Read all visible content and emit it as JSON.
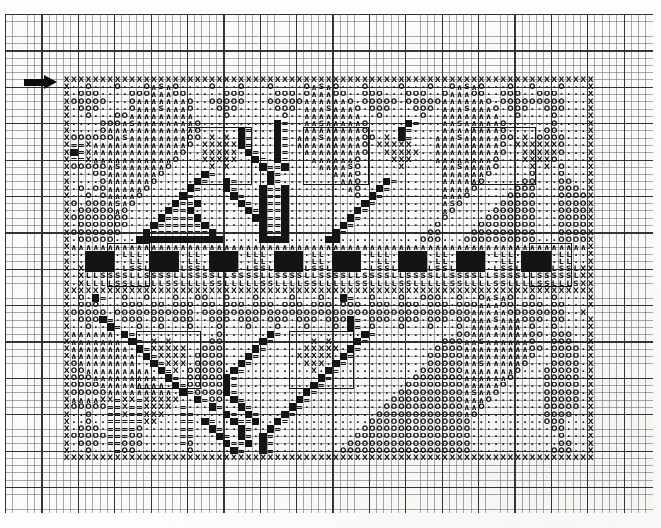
{
  "document": {
    "kind": "cross-stitch pattern chart",
    "title": "Cross-Stitch Pattern Chart",
    "medium": "printed graph paper, photocopied / scanned"
  },
  "paper": {
    "x": 5,
    "y": 14,
    "width": 648,
    "height": 499,
    "background_color": "#fbfbf9",
    "minor_line_color": "#5f646e",
    "major_line_color": "#282c34",
    "cell_size_px": 7.277,
    "major_every": 5,
    "columns": 89,
    "rows": 68
  },
  "markers": {
    "start_arrow": {
      "name": "start-row-arrow",
      "x": 24,
      "y": 75,
      "width": 36,
      "height": 15,
      "direction": "right",
      "color": "#0b0b0b",
      "meaning": "marks the first charted row"
    }
  },
  "chart": {
    "origin_x": 63,
    "origin_y": 76,
    "cell_size_px": 7.277,
    "columns": 73,
    "rows": 53,
    "symbol_legend": [
      {
        "key": "X",
        "glyph": "X",
        "name": "cross-symbol"
      },
      {
        "key": ".",
        "glyph": "·",
        "name": "dot-symbol"
      },
      {
        "key": "O",
        "glyph": "O",
        "name": "circle-symbol"
      },
      {
        "key": "A",
        "glyph": "∧",
        "name": "caret-symbol"
      },
      {
        "key": "S",
        "glyph": "S",
        "name": "s-symbol"
      },
      {
        "key": "=",
        "glyph": "=",
        "name": "equals-symbol"
      },
      {
        "key": "L",
        "glyph": "L",
        "name": "l-symbol"
      },
      {
        "key": "#",
        "glyph": "",
        "name": "filled-block-symbol"
      },
      {
        "key": " ",
        "glyph": "",
        "name": "empty-cell"
      }
    ],
    "rows_data": [
      "XXXXXXXXXXXXXXXXXXXXXXXXXXXXXXXXXXXXXXXXXXXXXXXXXXXXXXXXXXXXXXXXXXXXXXXXX",
      "X..O...O...OASAO....O...O...O....OASAO...O....O...O..OASAO...O..O...O...X",
      "X.OOO....OOOAAAOO.....OOO....OOO.OAAAOO..OOO...OOO..OAAAOO..OOO..OOO....X",
      "XOOOOO...OAAAAAAAO..OOOOO...OOOOOAAAAAAO.OOOOO.OOOOOAAAAAAO.OOOOOOOOO...X",
      "X.OOO....OAAASAAAO...OOO.....OOO.AAASAAAO.OOO...OOO.AAASAAAO.OOO..OOO...X",
      "X..O...OOAAAAAAAAA....O.......O..AAAAAAAA..O.....O..AAAAAAAA..O....O....X",
      "X....OOOASAAAAAAAAO..........#=..AASAAAAAO.....#=...AASAAAAAO......O....X",
      "X....OAAAAAAAAAAAAO.....#=...#=..AAAAAAAAO....#=....AAAAAAAAO.....OO....X",
      "XOOOOOOASAAAAAAAAOO.X.X.#=...#=.AAASAAAAAOO.X.#=...AAASAAAAAOO.X.OOOO...X",
      "X==XAAAAAAAAAAAAAO.XXXXX#=...#=.AAAAAAAAAO.XXXXX...AAAAAAAAAO.XXXXXXO...X",
      "X#=XAAAAAAAAAAAAO..XXXXX.#=..#=..AAAAAAAAO..XXXXX..AAAAAAAAAO..XXXXXO...X",
      "X==XAAAAAAAAAAAO...XXXXX..#=.#=...AAAAAAO....XXX...AAAAAAAAO...XXXXO....X",
      "XOOOOOASAAAAAAO.....X.X....#==#....AAAASO.....X.....AASAAAAO....X.X.O...X",
      "X...OOAAAAAAAO.....#=.......#=.......AAAO...........AAAAAAO.....O...O...X",
      "X....OAAAAAAO.....#=..#=....#=........AAO...#=......AAAAAO.....OO...OO..X",
      "X.O.OOAAAAAO.....#=...#=...#==#........AO..#=.......AAAAO.....OOO...OOO.X",
      "X..O.OAAAAO.....#=.....#=..#==#.........O.#=........AAAO.....OOOO...OOOOX",
      "XO.OOOASAO.....#==#.....#=.#==#..........#=.........ASO.....OOOOO...OOOOX",
      "X.OOOOOAO.....#==#.......#=#==#.........#=..........AO.....OOOOOO...OOOOX",
      "XOOOOOOOO....#====#.......##==#........#=...........O.....OOOOOOO...OOOOX",
      "X.OOOOOOO...#======#.......#==#.......#=...........O.....OOOOOOOO...OOOOX",
      "XOOOOOOO...#========#......#==#......#=...........OO....OOOOOOOOO...OOOOX",
      "X.OOOOO...############.....####.....##...........OOO...OOOOOOOOOO...OOOOX",
      "XAAAAAAAAAAAAAAAAAAAAAAAAAAAAAAAAAAAAAAAAAAAAAAAAAAAAAAAAAAAAAAAAAAAAAAAX",
      "X..####.LLL.####.LL.####.LLL.####.LL.####.LLL.####.LL.####.LLL.####.LL..X",
      "X..####..LL.####.LL.####..LL.####.LL.####..LL.####.LL.####..LL.####.LL..X",
      "X.X####.LSSL####LSSL####.LSSL####LSSL####.LSSL####LSSL####.LSSL####LSSLXX",
      "X.XLLSSSSLLSSSSLLSSSSLLSSSSLLSSSSLLSSSSLLSSSSLLSSSSLLSSSSLLSSSSLLSSSSSLXX",
      "X.XLLLLSSLLLLLSSLLLLSSLLLLLSSLLLLSSLLLLLSSLLLLSSLLLLLSSLLLLSSLLLLSSLLLSXX",
      "XXXXXXXXXXXXXXXXXXXXXXXXXXXXXXXXXXXXXXXXXXXXXXXXXXXXXXXXXXXXXXXXXXXXXXXXX",
      "X.O.#=..O..O...O..OO..O...O....O...O..#=..O...O..OOO..O..OASAO..O..O....X",
      "X.OOO...OOO.OO.OOO.OO.OOO.OOO.OOO.OOO.OOO.OOO.OOO.OOO.OOOAAAOO.OOO.OO...X",
      "XOOOOO.OOOOOOOOOOO.OOOOOOOOOOOOOOOOOOOOOOOOOOOOOOOOOOOOOAAAAAOOOOOOOO..X",
      "X.OOO#=.OOO.OO.OOO..OOO.OOO.OOO.OOO.OOO#=.OOO.OOO.OOO.OOAAASAAAOOO.OO...X",
      "X..O..#=..O..O...O...O...O...O...O...O.#=.O...O...O...O.AAAAAAA.O..O....X",
      "XAAAAAA.#=...........O......#=...........#=...........OOAAAAAAAAOO.OOO..X",
      "XAAAAAAA.#=.X.X.....OO.....#=.....X.X...#=..........OOOAASAAAAAAO..OOO..X",
      "XAAAAAAAA.#=XXXXX..OOO....#=.....XXXXX.#=..........OOOOAAAAAAAAAOO.OOOO.X",
      "XAAAAAAAAA.#=XXXX.OOOO...#=.....XXXXX.#=..........OOOOOAAAAAAAAAO..OOOO.X",
      "XOAAAAAAAA..#=XXX.OOOO..#=.......XXX.#=...........OOOOOAASAAAAAO...OOOO.X",
      "XOOAAAAAAAAA.#=X.OOOOO.#=.........X.#=...........OOOOOOAAAAAAAO...OOOOO.X",
      "XOOOAAAAAAAAA.#=.OOOOO#=...........#=...........OOOOOOOAAAAAAO....OOOOO.X",
      "XOOOOAAAAAAAAA.#=OOOOO#=..........#=...........OOOOOOOOAAAAAO.....OOOOO.X",
      "XOOOOOAAAAAAAAA.#=OOOO#=.........#=...........OOOOOOOOOASAAO......OOOOO.X",
      "XAAAAXX=XX=XXXXX..#=OO.#=.......#=...........OOOOOOOOOOAAAO.......OOOOO.X",
      "XOOOOO==X==XXXX.=...#=..#=.....#=...........OOOOOOOOOOOAAO........OOOOO.X",
      "X..O..==X==XXX..==....#=.#=...#=...........OOOOOOOOOOOOAO.........OOOO..X",
      "X..O..=====XX...==.#=..#==#..#=...........OOOOOOOOOOOOOO..........OOO...X",
      "X.OOO.====O.....==..#=..#=..#=...........OOOOOOOOOOOOOOO...........OO...X",
      "XOOOOO===OO.....==...#=.#=.#=...........OOOOOOOOOOOOOOOO............O...X",
      "X.OOO.==OOO.....=O....#==#.#=..........OOOOOOOOOOOOOOOOO............OO..X",
      "X..O...=OO.......O.....#=..#=.........OOOOOOOOOOOOOOOOOO...........OOO..X",
      "XXXXXXXXXXXXXXXXXXXXXXXXXXXXXXXXXXXXXXXXXXXXXXXXXXXXXXXXXXXXXXXXXXXXXXXXX"
    ]
  },
  "motif_outlines": [
    {
      "name": "motif-outline-left-diamond",
      "col": 6,
      "row": 23,
      "cols": 6,
      "rows": 6
    },
    {
      "name": "motif-outline-upper-left-flower",
      "col": 17,
      "row": 7,
      "cols": 9,
      "rows": 8
    },
    {
      "name": "motif-outline-upper-center-flower",
      "col": 33,
      "row": 7,
      "cols": 9,
      "rows": 8
    },
    {
      "name": "motif-outline-upper-right-flower",
      "col": 56,
      "row": 7,
      "cols": 9,
      "rows": 8
    },
    {
      "name": "motif-outline-lower-left-flower",
      "col": 10,
      "row": 35,
      "cols": 9,
      "rows": 8
    },
    {
      "name": "motif-outline-lower-right-flower",
      "col": 31,
      "row": 35,
      "cols": 9,
      "rows": 8
    },
    {
      "name": "motif-outline-right-diamond",
      "col": 64,
      "row": 23,
      "cols": 6,
      "rows": 6
    }
  ]
}
